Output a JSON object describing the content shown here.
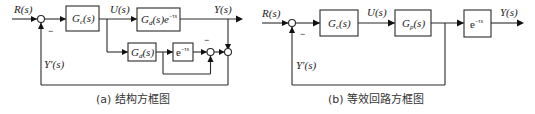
{
  "diagram_a": {
    "caption": "(a) 结构方框图",
    "labels": {
      "input": "R(s)",
      "control": "U(s)",
      "output": "Y(s)",
      "feedback": "Y'(s)",
      "minus_main": "−",
      "minus_inner": "−"
    },
    "blocks": {
      "controller": {
        "main": "G",
        "sub": "c",
        "arg": "(s)"
      },
      "plant_with_delay": {
        "main": "G",
        "sub": "d",
        "arg": "(s)e",
        "sup": "−τs"
      },
      "model": {
        "main": "G",
        "sub": "d",
        "arg": "(s)"
      },
      "delay": {
        "main": "e",
        "sup": "−τs"
      }
    }
  },
  "diagram_b": {
    "caption": "(b) 等效回路方框图",
    "labels": {
      "input": "R(s)",
      "control": "U(s)",
      "output": "Y(s)",
      "feedback": "Y'(s)",
      "minus_main": "−"
    },
    "blocks": {
      "controller": {
        "main": "G",
        "sub": "c",
        "arg": "(s)"
      },
      "plant": {
        "main": "G",
        "sub": "p",
        "arg": "(s)"
      },
      "delay": {
        "main": "e",
        "sup": "−τs"
      }
    }
  }
}
